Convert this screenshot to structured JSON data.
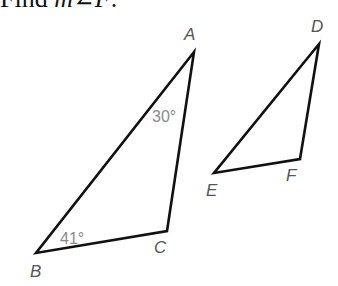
{
  "prompt": {
    "prefix": "Find ",
    "variable": "m∠F",
    "suffix": "."
  },
  "triangles": [
    {
      "name": "ABC",
      "vertices": [
        {
          "label": "A",
          "x": 194,
          "y": 52,
          "label_x": 184,
          "label_y": 40
        },
        {
          "label": "B",
          "x": 36,
          "y": 253,
          "label_x": 30,
          "label_y": 277
        },
        {
          "label": "C",
          "x": 167,
          "y": 231,
          "label_x": 154,
          "label_y": 253
        }
      ],
      "angles": [
        {
          "at": "A",
          "text": "30°",
          "x": 152,
          "y": 122
        },
        {
          "at": "B",
          "text": "41°",
          "x": 60,
          "y": 244
        }
      ]
    },
    {
      "name": "DEF",
      "vertices": [
        {
          "label": "D",
          "x": 319,
          "y": 44,
          "label_x": 311,
          "label_y": 32
        },
        {
          "label": "E",
          "x": 214,
          "y": 173,
          "label_x": 206,
          "label_y": 196
        },
        {
          "label": "F",
          "x": 300,
          "y": 159,
          "label_x": 286,
          "label_y": 181
        }
      ],
      "angles": []
    }
  ],
  "colors": {
    "edge": "#111111",
    "vertex_label": "#555555",
    "angle_label": "#8a8a8a"
  }
}
